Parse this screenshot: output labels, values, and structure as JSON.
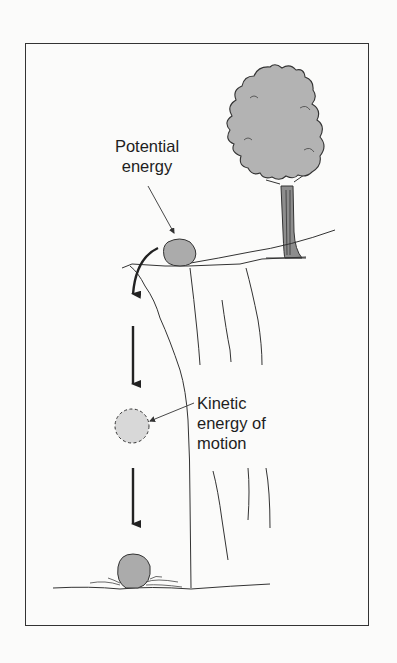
{
  "diagram": {
    "title": "",
    "labels": {
      "potential": {
        "line1": "Potential",
        "line2": "energy"
      },
      "kinetic": {
        "line1": "Kinetic",
        "line2": "energy of",
        "line3": "motion"
      }
    },
    "elements": [
      "tree",
      "cliff",
      "rock-at-top",
      "falling-rock-dashed",
      "rock-on-ground",
      "curved-arrow",
      "down-arrow-1",
      "down-arrow-2",
      "ground-line"
    ],
    "colors": {
      "line": "#333333",
      "fill_gray": "#a9a9a9",
      "fill_light": "#cfcfcf",
      "background": "#fbfbfa"
    }
  }
}
